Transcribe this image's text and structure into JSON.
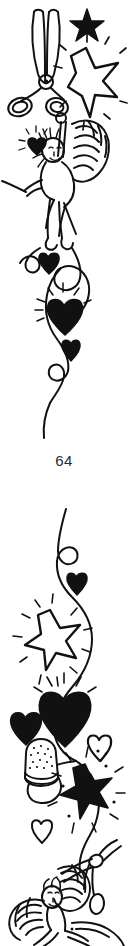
{
  "page": {
    "folio_number": "64",
    "background_color": "#ffffff",
    "ink_color": "#111111",
    "width": 128,
    "height": 946
  },
  "panels": [
    {
      "id": "top-illustration",
      "title": "Cherub with scissors, stars, hearts and ribbon",
      "elements": [
        {
          "name": "scissors",
          "style": "outline",
          "note": "open shears, two oval handles, pivot rivet"
        },
        {
          "name": "small-solid-star",
          "style": "filled",
          "points": 5
        },
        {
          "name": "large-outline-star",
          "style": "outline",
          "points": 5,
          "rays": true
        },
        {
          "name": "cherub",
          "style": "outline",
          "note": "winged putto holding scissors, feathered wing"
        },
        {
          "name": "heart-with-rays",
          "style": "filled",
          "rays": true
        },
        {
          "name": "small-heart",
          "style": "filled"
        },
        {
          "name": "tiny-heart",
          "style": "filled"
        },
        {
          "name": "ribbon-swirl",
          "style": "outline",
          "note": "curling trailing ribbon with loops"
        }
      ]
    },
    {
      "id": "bottom-illustration",
      "title": "Ribbon with star, hearts, thimble and cherub",
      "elements": [
        {
          "name": "ribbon-swirl",
          "style": "outline",
          "note": "long curling ribbon with loops"
        },
        {
          "name": "tiny-heart",
          "style": "filled"
        },
        {
          "name": "large-outline-star",
          "style": "outline",
          "points": 5,
          "rays": true
        },
        {
          "name": "heart-with-rays",
          "style": "filled",
          "rays": true
        },
        {
          "name": "small-heart",
          "style": "filled"
        },
        {
          "name": "thimble",
          "style": "outline",
          "note": "stippled sewing thimble"
        },
        {
          "name": "outline-heart",
          "style": "outline"
        },
        {
          "name": "solid-star-burst",
          "style": "filled",
          "points": 5,
          "rays": true,
          "dots": true
        },
        {
          "name": "cherub",
          "style": "outline",
          "note": "winged putto reaching for scissors"
        },
        {
          "name": "scissors",
          "style": "outline",
          "note": "partial shears at upper right"
        }
      ]
    }
  ]
}
